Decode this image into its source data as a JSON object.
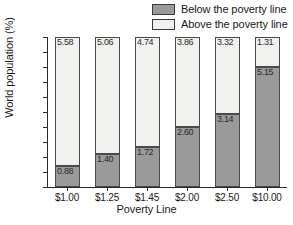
{
  "chart_data": {
    "type": "bar",
    "subtype": "stacked-bar-100",
    "title": "",
    "xlabel": "Poverty Line",
    "ylabel": "World population (%)",
    "categories": [
      "$1.00",
      "$1.25",
      "$1.45",
      "$2.00",
      "$2.50",
      "$10.00"
    ],
    "ylim": [
      0,
      100
    ],
    "yticks": [
      0,
      10,
      20,
      30,
      40,
      50,
      60,
      70,
      80,
      90,
      100
    ],
    "grid": false,
    "legend_position": "top-right",
    "value_label_units": "billions of people",
    "series": [
      {
        "name": "Below the poverty line",
        "color": "#9a9a9a",
        "values": [
          14.0,
          22.0,
          27.0,
          40.0,
          48.6,
          79.7
        ],
        "labels": [
          "0.88",
          "1.40",
          "1.72",
          "2.60",
          "3.14",
          "5.15"
        ]
      },
      {
        "name": "Above the poverty line",
        "color": "#f1f1ef",
        "values": [
          86.0,
          78.0,
          73.0,
          60.0,
          51.4,
          20.3
        ],
        "labels": [
          "5.58",
          "5.06",
          "4.74",
          "3.86",
          "3.32",
          "1.31"
        ]
      }
    ]
  },
  "legend": {
    "items": [
      {
        "label": "Below the poverty line",
        "swatch": "#9a9a9a"
      },
      {
        "label": "Above the poverty line",
        "swatch": "#f1f1ef"
      }
    ]
  },
  "axes": {
    "y_title": "World population (%)",
    "x_title": "Poverty Line",
    "y_tick_labels": [
      "100",
      "90",
      "80",
      "70",
      "60",
      "50",
      "40",
      "30",
      "20",
      "10",
      "0"
    ],
    "x_tick_labels": [
      "$1.00",
      "$1.25",
      "$1.45",
      "$2.00",
      "$2.50",
      "$10.00"
    ]
  }
}
